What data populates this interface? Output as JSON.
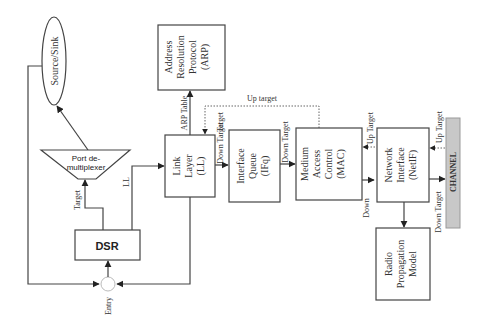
{
  "diagram": {
    "title": "",
    "nodes": {
      "source_sink": {
        "label": "Source/Sink",
        "shape": "ellipse"
      },
      "port_demux": {
        "line1": "Port de-",
        "line2": "multiplexer",
        "shape": "trapezoid"
      },
      "dsr": {
        "label": "DSR",
        "shape": "box"
      },
      "entry": {
        "label": "Entry",
        "shape": "circle"
      },
      "arp": {
        "line1": "Address",
        "line2": "Resolution",
        "line3": "Protocol",
        "line4": "(ARP)",
        "shape": "box"
      },
      "ll": {
        "line1": "Link",
        "line2": "Layer",
        "line3": "(LL)",
        "shape": "box"
      },
      "ifq": {
        "line1": "Interface",
        "line2": "Queue",
        "line3": "(IFq)",
        "shape": "box"
      },
      "mac": {
        "line1": "Medium",
        "line2": "Access",
        "line3": "Control",
        "line4": "(MAC)",
        "shape": "box"
      },
      "netif": {
        "line1": "Network",
        "line2": "Interface",
        "line3": "(NetIF)",
        "shape": "box"
      },
      "radio": {
        "line1": "Radio",
        "line2": "Propagation",
        "line3": "Model",
        "shape": "box"
      },
      "channel": {
        "label": "CHANNEL",
        "shape": "bar",
        "fill": "#c8c8c8"
      }
    },
    "edge_labels": {
      "target": "Target",
      "ll": "LL",
      "arp_table": "ARP Table",
      "up_target_top": "Up target",
      "ll_down_target": "Down Target",
      "ifq_down_target": "Down Target",
      "mac_up_target": "Up Target",
      "mac_down": "Down",
      "netif_up_target": "Up Target",
      "netif_down_target": "Down Target",
      "ll_target": "Target"
    }
  }
}
